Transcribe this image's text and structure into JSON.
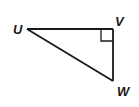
{
  "diagram": {
    "type": "right-triangle",
    "colors": {
      "stroke": "#1a1a1a",
      "background": "#ffffff"
    },
    "vertices": [
      {
        "name": "U",
        "label": "U",
        "x": 27,
        "y": 29
      },
      {
        "name": "V",
        "label": "V",
        "x": 113,
        "y": 29
      },
      {
        "name": "W",
        "label": "W",
        "x": 113,
        "y": 81
      }
    ],
    "right_angle_at": "V",
    "segments": [
      "UV",
      "VW",
      "UW"
    ]
  }
}
